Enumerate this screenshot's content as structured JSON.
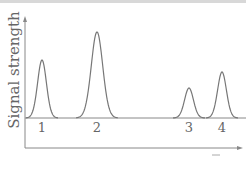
{
  "chart_data": {
    "type": "line",
    "title": "",
    "xlabel": "",
    "ylabel": "Signal strength",
    "grid": false,
    "legend": null,
    "baseline_y": 118,
    "peaks": [
      {
        "label": "1",
        "x": 42,
        "height": 58,
        "width": 5
      },
      {
        "label": "2",
        "x": 97,
        "height": 86,
        "width": 6.5
      },
      {
        "label": "3",
        "x": 189,
        "height": 30,
        "width": 5
      },
      {
        "label": "4",
        "x": 222,
        "height": 46,
        "width": 5
      }
    ],
    "values": [
      58,
      86,
      30,
      46
    ],
    "categories": [
      "1",
      "2",
      "3",
      "4"
    ]
  },
  "axes": {
    "y_label": "Signal strength",
    "line_color": "#888888",
    "curve_color": "#777777"
  }
}
